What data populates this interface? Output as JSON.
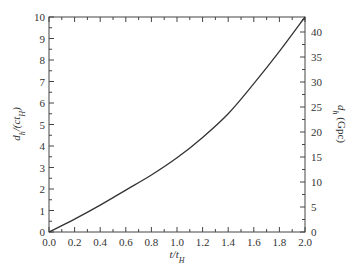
{
  "chart_data": {
    "type": "line",
    "title": "",
    "xlabel": "t/t_H",
    "ylabel": "d_h/(ct_H)",
    "ylabel_right": "d_h (Gpc)",
    "xlim": [
      0.0,
      2.0
    ],
    "ylim": [
      0,
      10
    ],
    "ylim_right": [
      0,
      43
    ],
    "grid": false,
    "legend": null,
    "x_ticks": [
      "0.0",
      "0.2",
      "0.4",
      "0.6",
      "0.8",
      "1.0",
      "1.2",
      "1.4",
      "1.6",
      "1.8",
      "2.0"
    ],
    "y_ticks": [
      "0",
      "1",
      "2",
      "3",
      "4",
      "5",
      "6",
      "7",
      "8",
      "9",
      "10"
    ],
    "y_ticks_right": [
      "0",
      "5",
      "10",
      "15",
      "20",
      "25",
      "30",
      "35",
      "40"
    ],
    "series": [
      {
        "name": "horizon distance",
        "x": [
          0.0,
          0.2,
          0.4,
          0.6,
          0.8,
          1.0,
          1.2,
          1.4,
          1.6,
          1.8,
          2.0
        ],
        "y": [
          0.0,
          0.6,
          1.25,
          1.95,
          2.65,
          3.45,
          4.4,
          5.5,
          6.9,
          8.4,
          10.0
        ]
      }
    ]
  }
}
